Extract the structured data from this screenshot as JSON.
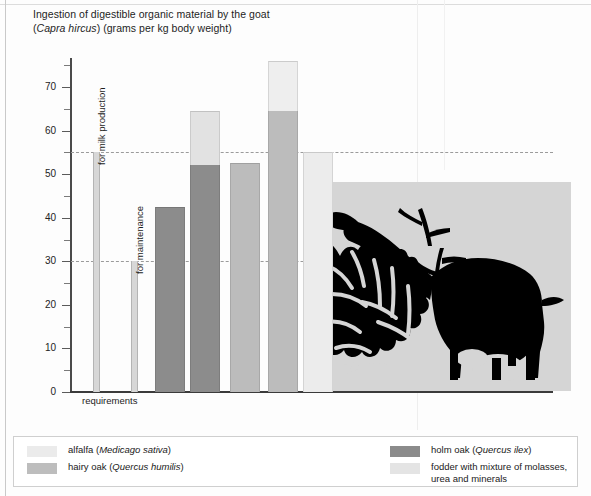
{
  "chart_data": {
    "type": "bar",
    "title": "Ingestion of digestible organic material by the goat (Capra hircus) (grams per kg body weight)",
    "title_line1_a": "Ingestion of digestible organic material by the goat",
    "title_line2_a": "(",
    "title_line2_italic": "Capra hircus",
    "title_line2_b": ") (grams per kg body weight)",
    "xlabel": "requirements",
    "ylabel": "",
    "ylim": [
      0,
      78
    ],
    "grid": false,
    "legend_position": "bottom",
    "ytick_labels": [
      "0",
      "10",
      "20",
      "30",
      "40",
      "50",
      "60",
      "70"
    ],
    "ytick_values": [
      0,
      10,
      20,
      30,
      40,
      50,
      60,
      70
    ],
    "yminor_values": [
      5,
      15,
      25,
      35,
      45,
      55,
      65,
      75
    ],
    "reference_lines": [
      {
        "label": "for milk production",
        "value": 55
      },
      {
        "label": "for maintenance",
        "value": 30
      }
    ],
    "requirement_bars": [
      {
        "name": "for milk production",
        "value": 55
      },
      {
        "name": "for maintenance",
        "value": 30
      }
    ],
    "categories": [
      "holm oak",
      "hairy oak + fodder",
      "hairy oak",
      "alfalfa + fodder",
      "fodder"
    ],
    "bars": [
      {
        "name": "bar-1",
        "total": 42.5,
        "segments": [
          {
            "series": "holm oak",
            "value": 42.5,
            "color": "#8c8c8c"
          }
        ]
      },
      {
        "name": "bar-2",
        "total": 64.5,
        "segments": [
          {
            "series": "holm oak",
            "value": 52.0,
            "color": "#8c8c8c"
          },
          {
            "series": "fodder",
            "value": 12.5,
            "color": "#e2e2e2"
          }
        ]
      },
      {
        "name": "bar-3",
        "total": 52.5,
        "segments": [
          {
            "series": "hairy oak",
            "value": 52.5,
            "color": "#bcbcbc"
          }
        ]
      },
      {
        "name": "bar-4",
        "total": 76.0,
        "segments": [
          {
            "series": "hairy oak",
            "value": 64.5,
            "color": "#bcbcbc"
          },
          {
            "series": "alfalfa",
            "value": 11.5,
            "color": "#eeeeee"
          }
        ]
      },
      {
        "name": "bar-5",
        "total": 55.0,
        "segments": [
          {
            "series": "fodder",
            "value": 55.0,
            "color": "#ececec"
          }
        ]
      }
    ],
    "legend": [
      {
        "label_plain": "alfalfa (",
        "label_italic": "Medicago sativa",
        "label_tail": ")",
        "color": "#ebebeb",
        "column": "left"
      },
      {
        "label_plain": "hairy oak (",
        "label_italic": "Quercus humilis",
        "label_tail": ")",
        "color": "#bdbdbd",
        "column": "left"
      },
      {
        "label_plain": "holm oak (",
        "label_italic": "Quercus ilex",
        "label_tail": ")",
        "color": "#8b8b8b",
        "column": "right"
      },
      {
        "label_plain": "fodder with mixture of molasses,",
        "label_italic": "",
        "label_tail": "urea and minerals",
        "color": "#e4e4e4",
        "column": "right"
      }
    ],
    "illustration": {
      "name": "goat-browsing-shrub-silhouette",
      "description": "Black silhouette of a goat browsing leaves from a shrub",
      "background_color": "#d4d4d4",
      "silhouette_color": "#000000"
    },
    "colors": {
      "holm_oak": "#8c8c8c",
      "hairy_oak": "#bcbcbc",
      "alfalfa": "#ebebeb",
      "fodder": "#e4e4e4",
      "axis": "#3b3b3b",
      "gridline": "#9b9b9b"
    }
  }
}
